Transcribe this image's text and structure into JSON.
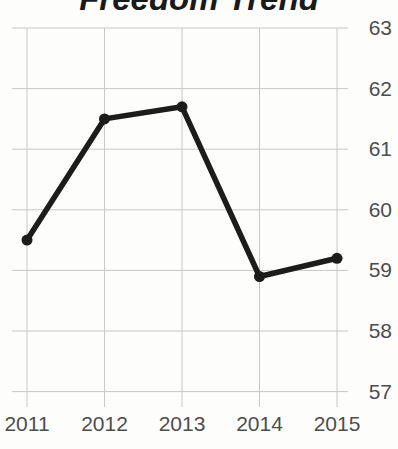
{
  "chart_data": {
    "type": "line",
    "title": "Freedom Trend",
    "categories": [
      "2011",
      "2012",
      "2013",
      "2014",
      "2015"
    ],
    "values": [
      59.5,
      61.5,
      61.7,
      58.9,
      59.2
    ],
    "y_ticks": [
      63,
      62,
      61,
      60,
      59,
      58,
      57
    ],
    "ylim": [
      57,
      63
    ],
    "xlabel": "",
    "ylabel": "",
    "grid": true,
    "legend_position": "none",
    "y_axis_side": "right",
    "colors": {
      "line": "#1c1c1c",
      "marker": "#1c1c1c",
      "grid": "#c8c8c4",
      "tick_label": "#4d4d4d",
      "title": "#1a1a1a",
      "background": "#fdfdfc"
    }
  }
}
